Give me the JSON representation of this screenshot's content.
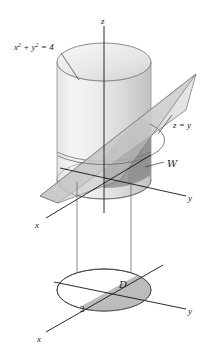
{
  "figure": {
    "background_color": "#ffffff",
    "ink_color": "#141414",
    "labels": {
      "cylinder_equation": "x2 + y2 = 4",
      "cylinder_equation_base": "x",
      "cylinder_equation_mid": " + y",
      "cylinder_equation_tail": " = 4",
      "exponent": "2",
      "plane_equation": "z = y",
      "solid_region": "W",
      "projection_region": "D",
      "radius_tick": "2",
      "axis_z": "z",
      "axis_x_upper": "x",
      "axis_y_upper": "y",
      "axis_x_lower": "x",
      "axis_y_lower": "y"
    },
    "colors": {
      "cylinder_light": "#f2f2f2",
      "cylinder_mid": "#dcdcdc",
      "cylinder_dark": "#c6c6c6",
      "cylinder_top": "#e8e8e8",
      "plane_fill": "#c9c9c9",
      "plane_fill_light": "#d8d8d8",
      "solid_fill": "#9d9d9d",
      "disk_fill": "#ffffff",
      "disk_shaded": "#b8b8b8",
      "outline": "#5c6063",
      "leader": "#3a3a3a"
    },
    "geometry": {
      "upper_origin": [
        104,
        188
      ],
      "cylinder_center_top": [
        104,
        62
      ],
      "cylinder_rx": 47,
      "cylinder_ry": 19,
      "cylinder_top_y": 62,
      "cylinder_bottom_y": 180,
      "lower_origin": [
        104,
        290
      ],
      "disk_rx": 47,
      "disk_ry": 21,
      "z_axis_top": [
        104,
        26
      ],
      "projection_line_left_x": 77,
      "projection_line_right_x": 131
    },
    "annotations": [
      {
        "name": "cylinder-equation-leader",
        "from": [
          60,
          52
        ],
        "to": [
          78,
          78
        ]
      },
      {
        "name": "plane-equation-leader",
        "from": [
          176,
          112
        ],
        "to": [
          160,
          133
        ]
      },
      {
        "name": "solid-region-leader",
        "from": [
          165,
          161
        ],
        "to": [
          146,
          166
        ]
      }
    ]
  }
}
